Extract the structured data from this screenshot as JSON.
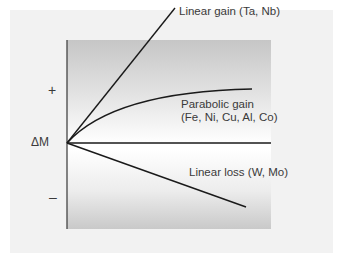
{
  "diagram": {
    "axis": {
      "y_label": "ΔM",
      "positive_label": "+",
      "negative_label": "–"
    },
    "curves": [
      {
        "id": "linear-gain",
        "label": "Linear gain (Ta, Nb)",
        "kind": "linear",
        "direction": "gain"
      },
      {
        "id": "parabolic-gain",
        "label_line1": "Parabolic gain",
        "label_line2": "(Fe, Ni, Cu, Al, Co)",
        "kind": "parabolic",
        "direction": "gain"
      },
      {
        "id": "linear-loss",
        "label": "Linear loss (W, Mo)",
        "kind": "linear",
        "direction": "loss"
      }
    ],
    "colors": {
      "line": "#1a1a1a",
      "axis": "#333333",
      "text": "#3a3a3a",
      "panel": "#f2f2f2",
      "gradient_edge": "#c6c6c6"
    }
  }
}
